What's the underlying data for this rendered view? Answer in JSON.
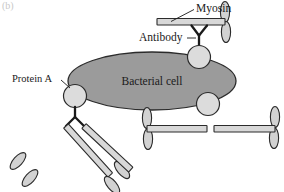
{
  "figure": {
    "panel_tag": "(b)",
    "caption_title": "Bacterial cell",
    "background_color": "#ffffff"
  },
  "labels": {
    "myosin": "Myosin",
    "antibody": "Antibody",
    "protein_a": "Protein A",
    "bacterial_cell": "Bacterial cell"
  },
  "colors": {
    "cell_fill": "#9b9b9b",
    "cell_stroke": "#2b2b2b",
    "circle_fill": "#dcdcdc",
    "circle_stroke": "#2b2b2b",
    "rod_fill": "#d8d8d8",
    "rod_stroke": "#2b2b2b",
    "head_fill": "#d2d2d2",
    "head_stroke": "#2b2b2b",
    "antibody_stroke": "#1a1a1a",
    "text": "#1a1a1a"
  },
  "shapes": {
    "bacterial_cell": {
      "name": "bacterial-cell-ellipse",
      "cx": 152,
      "cy": 81,
      "rx": 84,
      "ry": 29
    },
    "protein_a_circles": [
      {
        "name": "protein-a-circle-left",
        "cx": 75,
        "cy": 96,
        "r": 11.5
      },
      {
        "name": "protein-a-circle-top",
        "cx": 199,
        "cy": 57,
        "r": 11.5
      },
      {
        "name": "protein-a-circle-right",
        "cx": 208,
        "cy": 104,
        "r": 11.5
      }
    ],
    "myosin_molecules": [
      {
        "name": "myosin-top",
        "orientation": "horizontal",
        "heads": 2
      },
      {
        "name": "myosin-lower-left",
        "orientation": "diagonal",
        "heads": 2
      },
      {
        "name": "myosin-lower-right",
        "orientation": "diagonal",
        "heads": 2
      },
      {
        "name": "myosin-bottom-inner",
        "orientation": "horizontal",
        "heads": 2
      },
      {
        "name": "myosin-bottom-outer",
        "orientation": "horizontal",
        "heads": 2
      }
    ],
    "antibodies": [
      {
        "name": "antibody-top",
        "shape": "Y-upright"
      },
      {
        "name": "antibody-left",
        "shape": "Y-inverted"
      }
    ]
  }
}
